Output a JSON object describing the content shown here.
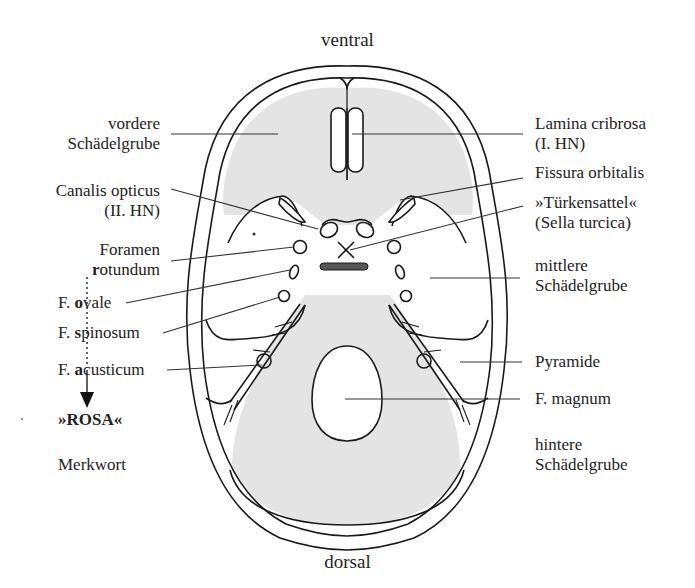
{
  "orientation": {
    "top": "ventral",
    "bottom": "dorsal"
  },
  "labels_left": {
    "vordere": [
      "vordere",
      "Schädelgrube"
    ],
    "canalis": [
      "Canalis opticus",
      "(II. HN)"
    ],
    "foramen": {
      "line1": "Foramen",
      "line2_bold": "r",
      "line2_rest": "otundum"
    },
    "ovale": {
      "prefix": "F. ",
      "bold": "o",
      "rest": "vale"
    },
    "spinosum": {
      "prefix": "F. ",
      "bold": "s",
      "rest": "pinosum"
    },
    "acusticum": {
      "prefix": "F. ",
      "bold": "a",
      "rest": "custicum"
    },
    "mnemonic": "»ROSA«",
    "mnemonic_caption": "Merkwort"
  },
  "labels_right": {
    "lamina": [
      "Lamina cribrosa",
      "(I. HN)"
    ],
    "fissura": "Fissura orbitalis",
    "sella": [
      "»Türkensattel«",
      "(Sella turcica)"
    ],
    "mittlere": [
      "mittlere",
      "Schädelgrube"
    ],
    "pyramide": "Pyramide",
    "magnum": "F. magnum",
    "hintere": [
      "hintere",
      "Schädelgrube"
    ]
  },
  "colors": {
    "fossa_fill": "#e4e4e4",
    "stroke": "#1a1a1a",
    "leader": "#333333",
    "sella_bar": "#555555"
  }
}
